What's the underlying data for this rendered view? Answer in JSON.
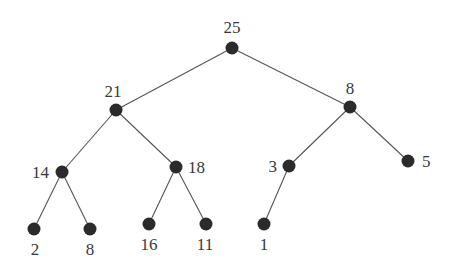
{
  "diagram": {
    "type": "binary-tree",
    "colors": {
      "node": "#2b2b2b",
      "edge": "#555555",
      "label": "#3a3a3a",
      "background": "#ffffff"
    },
    "nodes": [
      {
        "id": "n0",
        "label": "25",
        "x": 232,
        "y": 48,
        "lx": 232,
        "ly": 33,
        "anchor": "middle"
      },
      {
        "id": "n1",
        "label": "21",
        "x": 116,
        "y": 110,
        "lx": 113,
        "ly": 97,
        "anchor": "middle"
      },
      {
        "id": "n2",
        "label": "8",
        "x": 350,
        "y": 107,
        "lx": 350,
        "ly": 94,
        "anchor": "middle"
      },
      {
        "id": "n3",
        "label": "14",
        "x": 62,
        "y": 172,
        "lx": 49,
        "ly": 178,
        "anchor": "end"
      },
      {
        "id": "n4",
        "label": "18",
        "x": 176,
        "y": 167,
        "lx": 188,
        "ly": 173,
        "anchor": "start"
      },
      {
        "id": "n5",
        "label": "3",
        "x": 289,
        "y": 166,
        "lx": 277,
        "ly": 172,
        "anchor": "end"
      },
      {
        "id": "n6",
        "label": "5",
        "x": 408,
        "y": 161,
        "lx": 422,
        "ly": 167,
        "anchor": "start"
      },
      {
        "id": "n7",
        "label": "2",
        "x": 34,
        "y": 229,
        "lx": 35,
        "ly": 255,
        "anchor": "middle"
      },
      {
        "id": "n8",
        "label": "8",
        "x": 90,
        "y": 229,
        "lx": 90,
        "ly": 255,
        "anchor": "middle"
      },
      {
        "id": "n9",
        "label": "16",
        "x": 149,
        "y": 224,
        "lx": 149,
        "ly": 250,
        "anchor": "middle"
      },
      {
        "id": "n10",
        "label": "11",
        "x": 206,
        "y": 224,
        "lx": 205,
        "ly": 250,
        "anchor": "middle"
      },
      {
        "id": "n11",
        "label": "1",
        "x": 264,
        "y": 224,
        "lx": 264,
        "ly": 250,
        "anchor": "middle"
      }
    ],
    "edges": [
      {
        "from": "n0",
        "to": "n1"
      },
      {
        "from": "n0",
        "to": "n2"
      },
      {
        "from": "n1",
        "to": "n3"
      },
      {
        "from": "n1",
        "to": "n4"
      },
      {
        "from": "n2",
        "to": "n5"
      },
      {
        "from": "n2",
        "to": "n6"
      },
      {
        "from": "n3",
        "to": "n7"
      },
      {
        "from": "n3",
        "to": "n8"
      },
      {
        "from": "n4",
        "to": "n9"
      },
      {
        "from": "n4",
        "to": "n10"
      },
      {
        "from": "n5",
        "to": "n11"
      }
    ]
  }
}
